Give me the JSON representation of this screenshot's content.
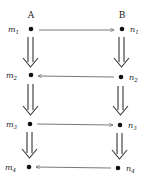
{
  "diagram": {
    "columns": [
      {
        "header": "A",
        "x": 31
      },
      {
        "header": "B",
        "x": 121
      }
    ],
    "left_nodes": [
      {
        "base": "m",
        "sub": "1",
        "x": 31,
        "y": 29
      },
      {
        "base": "m",
        "sub": "2",
        "x": 31,
        "y": 75
      },
      {
        "base": "m",
        "sub": "3",
        "x": 30,
        "y": 124
      },
      {
        "base": "m",
        "sub": "4",
        "x": 29,
        "y": 167
      }
    ],
    "right_nodes": [
      {
        "base": "n",
        "sub": "1",
        "x": 122,
        "y": 29
      },
      {
        "base": "n",
        "sub": "2",
        "x": 121,
        "y": 77
      },
      {
        "base": "n",
        "sub": "3",
        "x": 120,
        "y": 125
      },
      {
        "base": "n",
        "sub": "4",
        "x": 118,
        "y": 168
      }
    ],
    "horizontal_arrows": [
      {
        "from": "m1",
        "to": "n1",
        "direction": "right"
      },
      {
        "from": "n2",
        "to": "m2",
        "direction": "left"
      },
      {
        "from": "m3",
        "to": "n3",
        "direction": "right"
      },
      {
        "from": "n4",
        "to": "m4",
        "direction": "left"
      }
    ],
    "vertical_arrows": [
      {
        "from": "m1",
        "to": "m2",
        "style": "double"
      },
      {
        "from": "m2",
        "to": "m3",
        "style": "double"
      },
      {
        "from": "m3",
        "to": "m4",
        "style": "double"
      },
      {
        "from": "n1",
        "to": "n2",
        "style": "double"
      },
      {
        "from": "n2",
        "to": "n3",
        "style": "double"
      },
      {
        "from": "n3",
        "to": "n4",
        "style": "double"
      }
    ],
    "colors": {
      "ink": "#222222",
      "line": "#555555",
      "background": "#ffffff"
    }
  }
}
